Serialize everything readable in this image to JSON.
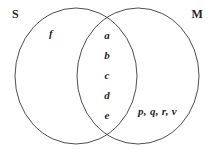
{
  "diagram": {
    "type": "venn",
    "title": "",
    "background_color": "#ffffff",
    "stroke_color": "#3a3a3a",
    "text_color": "#262626",
    "sets": [
      {
        "id": "S",
        "label": "S",
        "label_position": "top-left"
      },
      {
        "id": "M",
        "label": "M",
        "label_position": "top-right"
      }
    ],
    "regions": {
      "s_only": {
        "name": "S only",
        "items": [
          "f"
        ]
      },
      "intersection": {
        "name": "S and M",
        "items": [
          "a",
          "b",
          "c",
          "d",
          "e"
        ]
      },
      "m_only": {
        "name": "M only",
        "items": [
          "p, q, r, v"
        ]
      }
    }
  }
}
